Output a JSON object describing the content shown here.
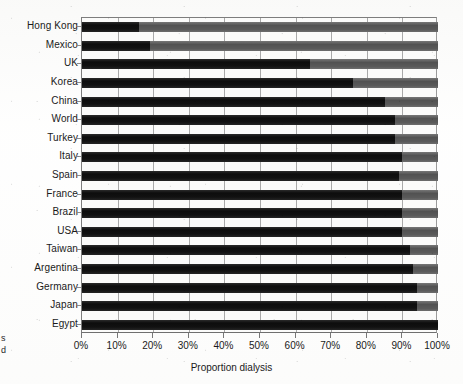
{
  "chart_data": {
    "type": "bar",
    "orientation": "horizontal",
    "stacked": true,
    "title": "",
    "xlabel": "Proportion dialysis",
    "ylabel": "",
    "xlim": [
      0,
      100
    ],
    "xunit": "%",
    "grid": "vertical",
    "legend": "none",
    "xticks": [
      "0%",
      "10%",
      "20%",
      "30%",
      "40%",
      "50%",
      "60%",
      "70%",
      "80%",
      "90%",
      "100%"
    ],
    "xtick_values": [
      0,
      10,
      20,
      30,
      40,
      50,
      60,
      70,
      80,
      90,
      100
    ],
    "categories": [
      "Hong Kong",
      "Mexico",
      "UK",
      "Korea",
      "China",
      "World",
      "Turkey",
      "Italy",
      "Spain",
      "France",
      "Brazil",
      "USA",
      "Taiwan",
      "Argentina",
      "Germany",
      "Japan",
      "Egypt"
    ],
    "series": [
      {
        "name": "dialysis",
        "color": "#161616",
        "values": [
          16,
          19,
          64,
          76,
          85,
          88,
          88,
          90,
          89,
          90,
          90,
          90,
          92,
          93,
          94,
          94,
          100
        ]
      },
      {
        "name": "remainder",
        "color": "#5d5d5d",
        "values": [
          84,
          81,
          36,
          24,
          15,
          12,
          12,
          10,
          11,
          10,
          10,
          10,
          8,
          7,
          6,
          6,
          0
        ]
      }
    ]
  },
  "page_bleed": {
    "line1": "s",
    "line2": "d"
  }
}
